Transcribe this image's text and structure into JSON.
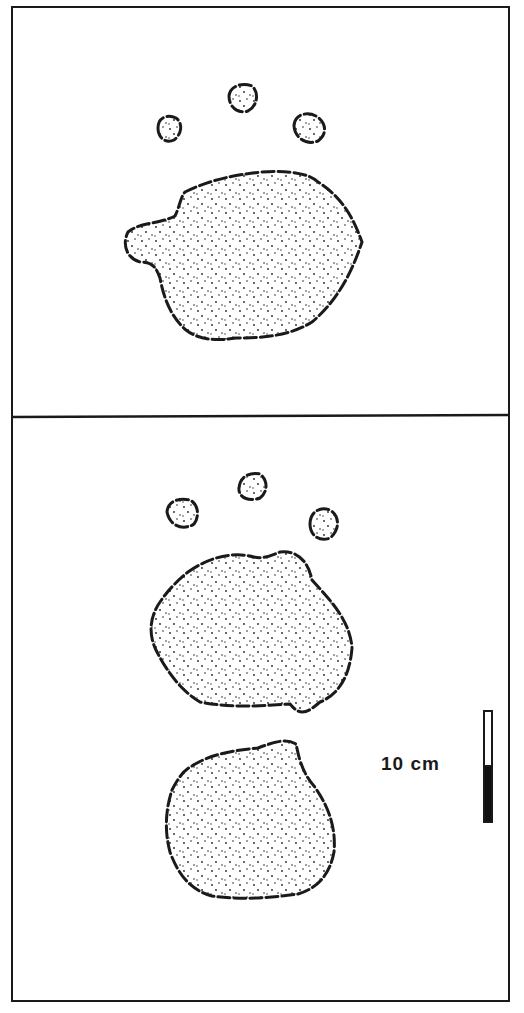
{
  "figure": {
    "panels": [
      {
        "name": "top-panel",
        "content": "single print: three small digit impressions above a large pad with a projecting lobe on the left"
      },
      {
        "name": "bottom-panel",
        "content": "print pair: three small digit impressions above a rounded pad, with a second rounded print below"
      }
    ],
    "scale_bar": {
      "label": "10 cm",
      "segments": [
        "white",
        "black"
      ]
    },
    "colors": {
      "ink": "#1a1a1a",
      "paper": "#ffffff"
    }
  }
}
